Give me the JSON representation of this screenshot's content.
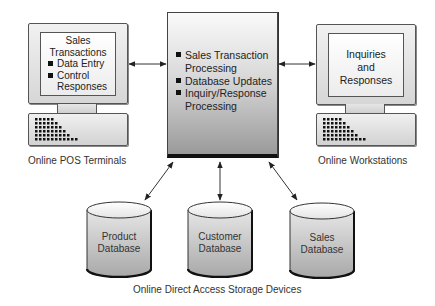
{
  "terminals_left": {
    "screen_title_line1": "Sales",
    "screen_title_line2": "Transactions",
    "items": [
      "Data Entry",
      "Control",
      "Responses"
    ],
    "caption": "Online POS Terminals"
  },
  "processor": {
    "items": [
      {
        "line1": "Sales Transaction",
        "line2": "Processing"
      },
      {
        "line1": "Database Updates",
        "line2": ""
      },
      {
        "line1": "Inquiry/Response",
        "line2": "Processing"
      }
    ]
  },
  "workstations_right": {
    "screen_lines": [
      "Inquiries",
      "and",
      "Responses"
    ],
    "caption": "Online Workstations"
  },
  "databases": [
    {
      "line1": "Product",
      "line2": "Database"
    },
    {
      "line1": "Customer",
      "line2": "Database"
    },
    {
      "line1": "Sales",
      "line2": "Database"
    }
  ],
  "storage_caption": "Online Direct Access Storage Devices",
  "colors": {
    "outline": "#555555",
    "fill_light": "#f1f1f1",
    "fill_dark": "#9a9a9a",
    "text": "#333333"
  }
}
